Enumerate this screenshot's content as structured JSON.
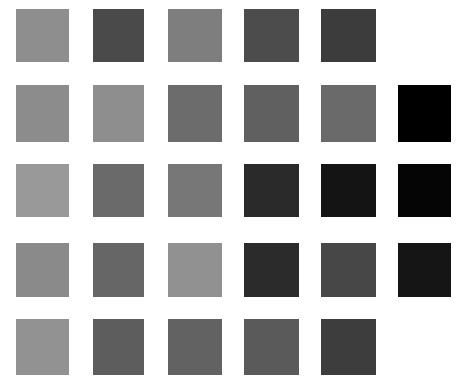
{
  "grid": {
    "columns_x": [
      16,
      93,
      168,
      244,
      321,
      398
    ],
    "rows_y": [
      9,
      85,
      164,
      243,
      319
    ],
    "widths": [
      53,
      51,
      54,
      55,
      55,
      53
    ],
    "heights": [
      53,
      57,
      53,
      54,
      56
    ],
    "rows": [
      [
        "#8e8e8e",
        "#4a4a4a",
        "#7e7e7e",
        "#4c4c4c",
        "#3c3c3c",
        null
      ],
      [
        "#8c8c8c",
        "#8e8e8e",
        "#6c6c6c",
        "#606060",
        "#6a6a6a",
        "#000000"
      ],
      [
        "#999999",
        "#6a6a6a",
        "#777777",
        "#2a2a2a",
        "#141414",
        "#050505"
      ],
      [
        "#8a8a8a",
        "#666666",
        "#919191",
        "#2b2b2b",
        "#474747",
        "#151515"
      ],
      [
        "#929292",
        "#5d5d5d",
        "#626262",
        "#5a5a5a",
        "#3d3d3d",
        null
      ]
    ]
  }
}
